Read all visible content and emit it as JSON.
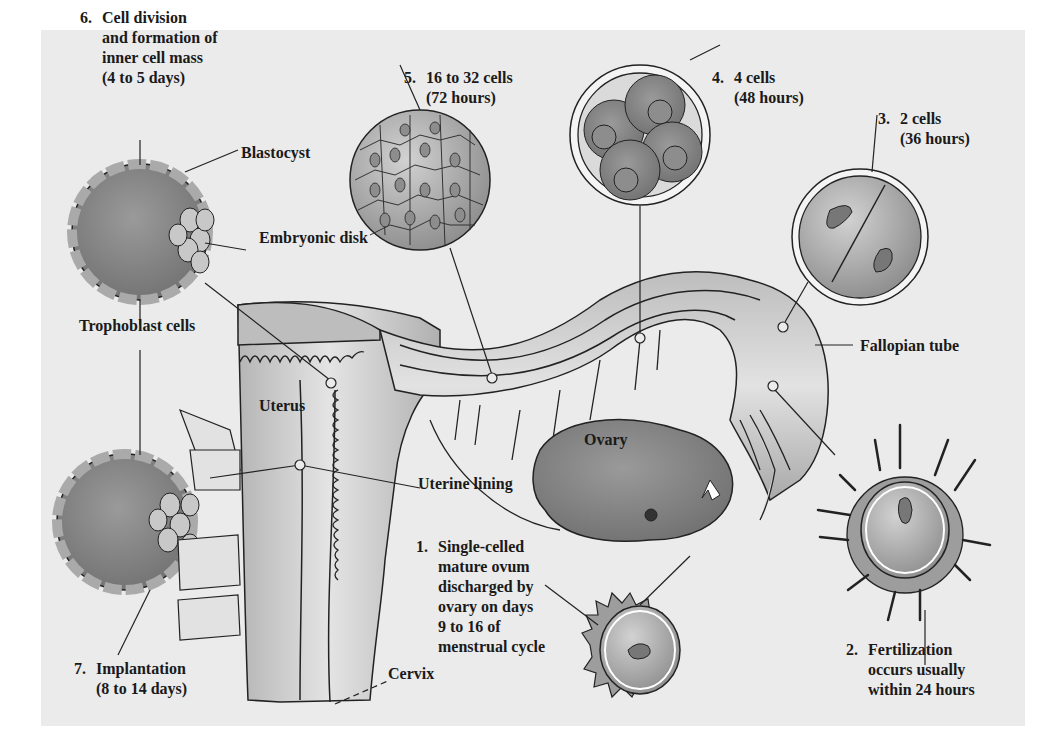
{
  "diagram": {
    "background_color": "#ebebeb",
    "stages": [
      {
        "number": "1.",
        "lines": [
          "Single-celled",
          "mature ovum",
          "discharged by",
          "ovary on days",
          "9 to 16 of",
          "menstrual cycle"
        ]
      },
      {
        "number": "2.",
        "lines": [
          "Fertilization",
          "occurs usually",
          "within 24 hours"
        ]
      },
      {
        "number": "3.",
        "lines": [
          "2 cells",
          "(36 hours)"
        ]
      },
      {
        "number": "4.",
        "lines": [
          "4 cells",
          "(48 hours)"
        ]
      },
      {
        "number": "5.",
        "lines": [
          "16 to 32 cells",
          "(72 hours)"
        ]
      },
      {
        "number": "6.",
        "lines": [
          "Cell division",
          "and formation of",
          "inner cell mass",
          "(4 to 5 days)"
        ]
      },
      {
        "number": "7.",
        "lines": [
          "Implantation",
          "(8 to 14 days)"
        ]
      }
    ],
    "anatomy_labels": {
      "blastocyst": "Blastocyst",
      "embryonic_disk": "Embryonic disk",
      "trophoblast_cells": "Trophoblast cells",
      "uterus": "Uterus",
      "uterine_lining": "Uterine lining",
      "ovary": "Ovary",
      "fallopian_tube": "Fallopian tube",
      "cervix": "Cervix"
    }
  }
}
